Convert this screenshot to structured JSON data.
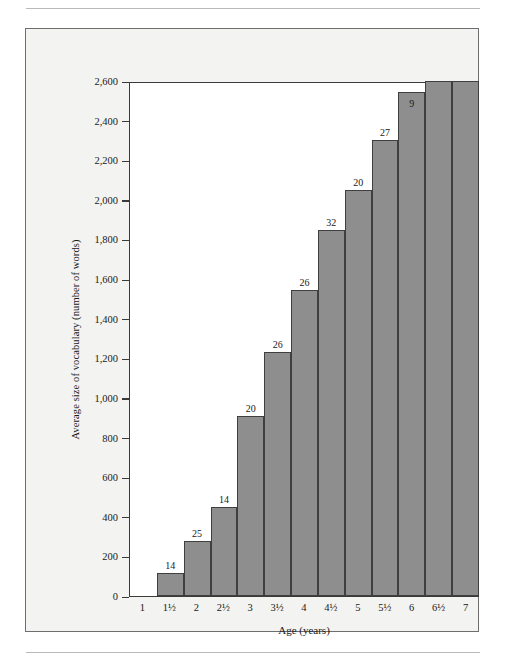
{
  "figure": {
    "background": "#f3f3f1",
    "frame_color": "#6e6e6e",
    "bar_color": "#8e8e8e",
    "bar_border_color": "#3f3f3f",
    "axis_color": "#3a3a3a"
  },
  "chart_data": {
    "type": "bar",
    "title": "",
    "xlabel": "Age (years)",
    "ylabel": "Average size of vocabulary (number of words)",
    "categories": [
      "1",
      "1½",
      "2",
      "2½",
      "3",
      "3½",
      "4",
      "4½",
      "5",
      "5½",
      "6",
      "6½",
      "7"
    ],
    "values": [
      0,
      115,
      280,
      450,
      910,
      1230,
      1545,
      1850,
      2050,
      2300,
      2545,
      2600,
      2600
    ],
    "point_labels": [
      "",
      "14",
      "25",
      "14",
      "20",
      "26",
      "26",
      "32",
      "20",
      "27",
      "9",
      "",
      ""
    ],
    "label_inside": [
      false,
      false,
      false,
      false,
      false,
      false,
      false,
      false,
      false,
      false,
      true,
      false,
      false
    ],
    "ylim": [
      0,
      2600
    ],
    "yticks": [
      0,
      200,
      400,
      600,
      800,
      1000,
      1200,
      1400,
      1600,
      1800,
      2000,
      2200,
      2400,
      2600
    ],
    "ytick_labels": [
      "0",
      "200",
      "400",
      "600",
      "800",
      "1,000",
      "1,200",
      "1,400",
      "1,600",
      "1,800",
      "2,000",
      "2,200",
      "2,400",
      "2,600"
    ],
    "grid": false,
    "legend": null
  }
}
